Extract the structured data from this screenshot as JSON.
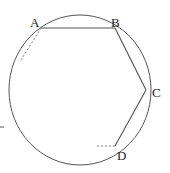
{
  "diagram": {
    "type": "inscribed polygon in circle",
    "colors": {
      "stroke": "#555555",
      "background": "#ffffff",
      "label": "#222222"
    },
    "circle": {
      "cx": 80,
      "cy": 90,
      "rx": 71,
      "ry": 75
    },
    "points": [
      {
        "id": "A",
        "label": "A",
        "x": 41,
        "y": 28,
        "lx": 30,
        "ly": 27
      },
      {
        "id": "B",
        "label": "B",
        "x": 115,
        "y": 28,
        "lx": 111,
        "ly": 27
      },
      {
        "id": "C",
        "label": "C",
        "x": 146,
        "y": 90,
        "lx": 152,
        "ly": 97
      },
      {
        "id": "D",
        "label": "D",
        "x": 115,
        "y": 146,
        "lx": 117,
        "ly": 160
      }
    ],
    "segments": [
      {
        "from": "A",
        "to": "B",
        "style": "solid"
      },
      {
        "from": "B",
        "to": "C",
        "style": "solid"
      },
      {
        "from": "C",
        "to": "D",
        "style": "solid"
      }
    ],
    "dashed_lines": [
      {
        "name": "tangent-at-A",
        "x1": 41,
        "y1": 28,
        "x2": 21,
        "y2": 60
      },
      {
        "name": "tangent-at-D",
        "x1": 115,
        "y1": 146,
        "x2": 96,
        "y2": 146
      }
    ],
    "tick": {
      "x1": 0,
      "y1": 127,
      "x2": 4,
      "y2": 127
    }
  }
}
